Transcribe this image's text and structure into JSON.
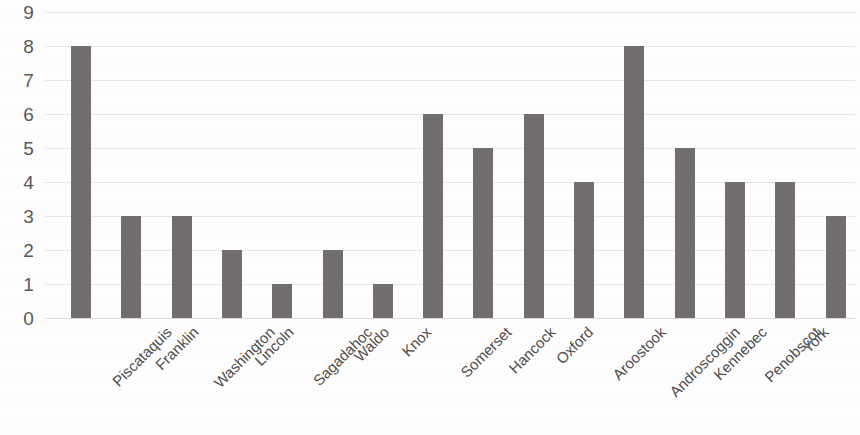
{
  "chart_data": {
    "type": "bar",
    "title": "",
    "subtitle": "",
    "xlabel": "",
    "ylabel": "",
    "ylim": [
      0,
      9
    ],
    "ytick_labels": [
      "9",
      "8",
      "7",
      "6",
      "5",
      "4",
      "3",
      "2",
      "1",
      "0"
    ],
    "ytick_values": [
      9,
      8,
      7,
      6,
      5,
      4,
      3,
      2,
      1,
      0
    ],
    "grid": true,
    "grid_axis": "y",
    "legend": false,
    "legend_position": "none",
    "bar_color": "#726E6D",
    "gridline_color": "#E9E7E6",
    "text_color": "#595959",
    "background_color": "#FDFDFD",
    "xtick_rotation": -45,
    "categories": [
      "Piscataquis",
      "Franklin",
      "Washington",
      "Lincoln",
      "Sagadahoc",
      "Waldo",
      "Knox",
      "Somerset",
      "Hancock",
      "Oxford",
      "Aroostook",
      "Androscoggin",
      "Kennebec",
      "Penobscot",
      "York",
      "Cumberland"
    ],
    "values": [
      8,
      3,
      3,
      2,
      1,
      2,
      1,
      6,
      5,
      6,
      4,
      8,
      5,
      4,
      4,
      3
    ]
  }
}
